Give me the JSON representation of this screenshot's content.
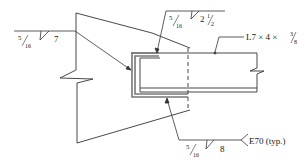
{
  "diagram": {
    "type": "welded-connection-detail",
    "member_label": "L7 × 4 × ",
    "member_label_frac_num": "3",
    "member_label_frac_den": "8",
    "welds": [
      {
        "id": "left",
        "size_num": "5",
        "size_den": "16",
        "length": "7"
      },
      {
        "id": "top",
        "size_num": "5",
        "size_den": "16",
        "length": "2",
        "length_frac_num": "1",
        "length_frac_den": "2"
      },
      {
        "id": "bottom",
        "size_num": "5",
        "size_den": "16",
        "length": "8",
        "tail_note": "E70 (typ.)"
      }
    ],
    "colors": {
      "line": "#222222",
      "weld": "#777777",
      "background": "#ffffff"
    }
  }
}
